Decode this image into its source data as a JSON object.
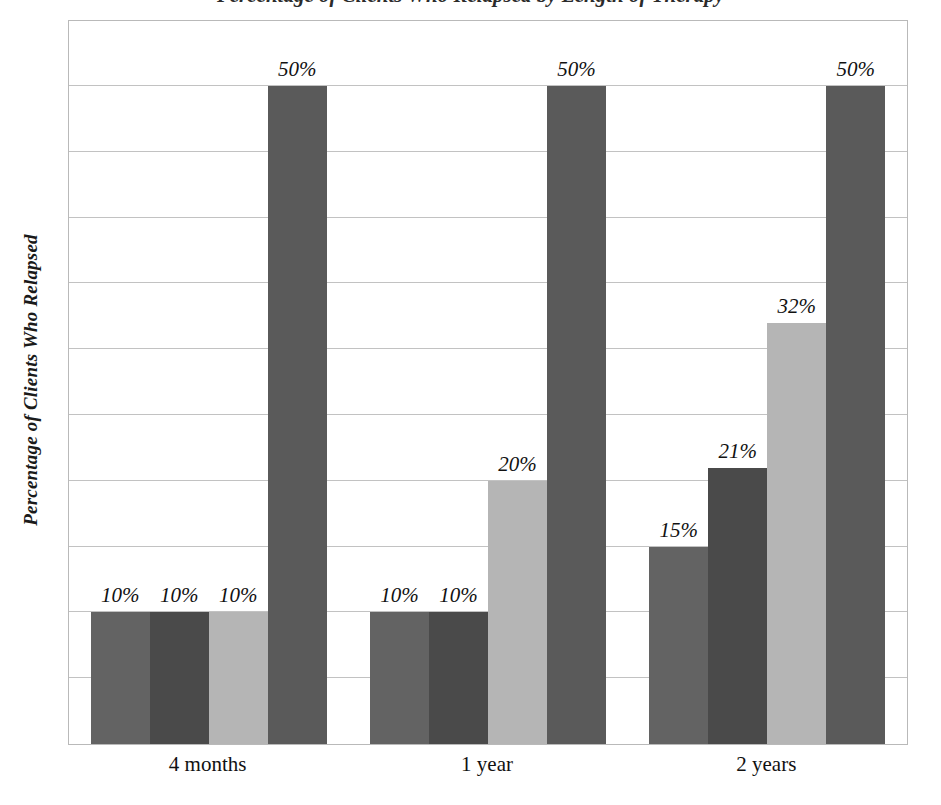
{
  "chart_data": {
    "type": "bar",
    "title": "Percentage of Clients Who Relapsed by Length of Therapy",
    "title_visible_fragment": "g     py,",
    "xlabel": "",
    "ylabel": "Percentage of Clients Who Relapsed",
    "categories": [
      "4 months",
      "1 year",
      "2 years"
    ],
    "ylim": [
      0,
      50
    ],
    "y_gridline_step": 5,
    "y_tick_labels_shown": false,
    "grid": true,
    "legend": "none",
    "series": [
      {
        "name": "Series 1",
        "color": "#636363",
        "values": [
          10,
          10,
          15
        ],
        "labels": [
          "10%",
          "10%",
          "15%"
        ]
      },
      {
        "name": "Series 2",
        "color": "#4a4a4a",
        "values": [
          10,
          10,
          21
        ],
        "labels": [
          "10%",
          "10%",
          "21%"
        ]
      },
      {
        "name": "Series 3",
        "color": "#b5b5b5",
        "values": [
          10,
          20,
          32
        ],
        "labels": [
          "10%",
          "20%",
          "32%"
        ]
      },
      {
        "name": "Series 4",
        "color": "#5a5a5a",
        "values": [
          50,
          50,
          50
        ],
        "labels": [
          "50%",
          "50%",
          "50%"
        ]
      }
    ]
  },
  "colors": {
    "series_1": "#636363",
    "series_2": "#4a4a4a",
    "series_3": "#b5b5b5",
    "series_4": "#5a5a5a",
    "gridline": "#c2c2c2",
    "plot_border": "#b9b9b9",
    "background": "#ffffff",
    "text": "#111111"
  }
}
